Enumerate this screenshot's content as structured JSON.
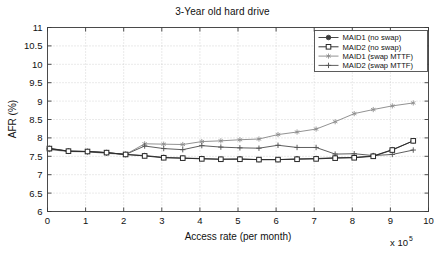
{
  "chart_data": {
    "type": "line",
    "title": "3-Year old hard drive",
    "xlabel": "Access rate (per month)",
    "ylabel": "AFR (%)",
    "x_exponent_label": "x 10",
    "x_exponent_power": "5",
    "xlim": [
      0,
      10
    ],
    "ylim": [
      6,
      11
    ],
    "xticks": [
      "0",
      "1",
      "2",
      "3",
      "4",
      "5",
      "6",
      "7",
      "8",
      "9",
      "10"
    ],
    "yticks": [
      "6",
      "6.5",
      "7",
      "7.5",
      "8",
      "8.5",
      "9",
      "9.5",
      "10",
      "10.5",
      "11"
    ],
    "grid": true,
    "legend_position": "top-right",
    "x": [
      0.05,
      0.55,
      1.05,
      1.55,
      2.05,
      2.55,
      3.05,
      3.55,
      4.05,
      4.55,
      5.05,
      5.55,
      6.05,
      6.55,
      7.05,
      7.55,
      8.05,
      8.55,
      9.05,
      9.6
    ],
    "series": [
      {
        "name": "MAID1 (no swap)",
        "marker": "filled-circle",
        "color": "#3c3c3c",
        "values": [
          7.7,
          7.64,
          7.63,
          7.6,
          7.55,
          7.52,
          7.47,
          7.45,
          7.44,
          7.42,
          7.43,
          7.41,
          7.41,
          7.43,
          7.44,
          7.46,
          7.47,
          7.51,
          7.68,
          7.92
        ]
      },
      {
        "name": "MAID2 (no swap)",
        "marker": "open-square",
        "color": "#2a2a2a",
        "values": [
          7.71,
          7.64,
          7.63,
          7.6,
          7.55,
          7.51,
          7.46,
          7.45,
          7.43,
          7.42,
          7.42,
          7.41,
          7.41,
          7.42,
          7.43,
          7.45,
          7.46,
          7.5,
          7.67,
          7.92
        ]
      },
      {
        "name": "MAID1 (swap MTTF)",
        "marker": "star",
        "color": "#8c8c8c",
        "values": [
          7.68,
          7.63,
          7.62,
          7.58,
          7.55,
          7.84,
          7.83,
          7.82,
          7.9,
          7.92,
          7.95,
          7.97,
          8.09,
          8.16,
          8.24,
          8.44,
          8.66,
          8.77,
          8.87,
          8.95
        ]
      },
      {
        "name": "MAID2 (swap MTTF)",
        "marker": "plus",
        "color": "#555555",
        "values": [
          7.72,
          7.64,
          7.63,
          7.6,
          7.55,
          7.78,
          7.71,
          7.68,
          7.79,
          7.75,
          7.73,
          7.72,
          7.8,
          7.74,
          7.74,
          7.56,
          7.57,
          7.52,
          7.55,
          7.67
        ]
      }
    ]
  }
}
